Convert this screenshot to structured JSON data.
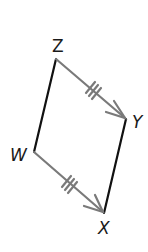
{
  "figure": {
    "type": "parallelogram with vectors",
    "vertices": {
      "Z": {
        "label": "Z"
      },
      "Y": {
        "label": "Y"
      },
      "W": {
        "label": "W"
      },
      "X": {
        "label": "X"
      }
    },
    "segments": [
      {
        "from": "W",
        "to": "Z",
        "style": "solid black"
      },
      {
        "from": "Y",
        "to": "X",
        "style": "solid black"
      },
      {
        "from": "Z",
        "to": "Y",
        "style": "gray vector arrow",
        "tick_marks": 3
      },
      {
        "from": "W",
        "to": "X",
        "style": "gray vector arrow",
        "tick_marks": 3
      }
    ],
    "colors": {
      "side": "#111111",
      "vector": "#7a7a7a"
    }
  }
}
